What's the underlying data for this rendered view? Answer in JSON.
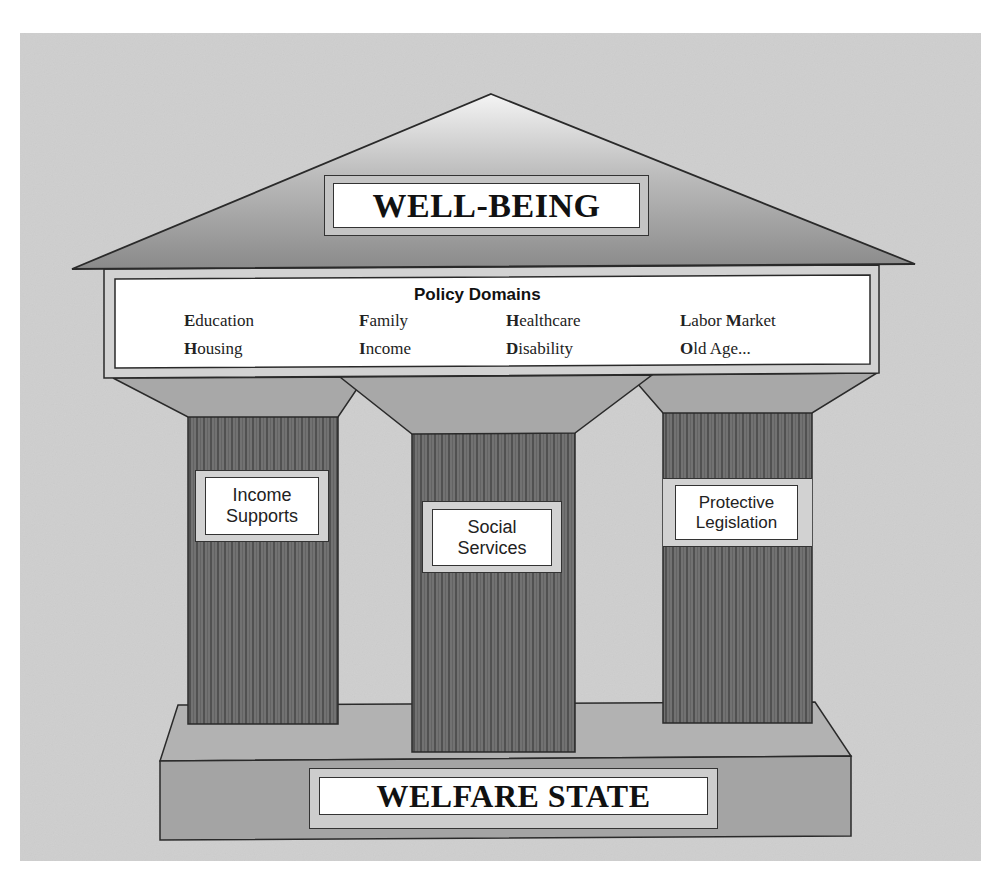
{
  "diagram": {
    "colors": {
      "background_panel": "#cfcfcf",
      "roof_top": "#f2f2f2",
      "roof_bottom": "#8c8c8c",
      "capital_fill": "#a9a9a9",
      "pillar_fill": "#6e6e6e",
      "pillar_stripe": "#3c3c3c",
      "base_top": "#b5b5b5",
      "base_front": "#a3a3a3",
      "outline": "#2a2a2a",
      "label_frame": "#d2d2d2",
      "label_inner": "#ffffff"
    },
    "roof": {
      "label": "WELL-BEING"
    },
    "entablature": {
      "heading": "Policy Domains",
      "domains": [
        {
          "initial": "E",
          "rest": "ducation"
        },
        {
          "initial": "F",
          "rest": "amily"
        },
        {
          "initial": "H",
          "rest": "ealthcare"
        },
        {
          "initial": "L",
          "rest": "abor ",
          "initial2": "M",
          "rest2": "arket"
        },
        {
          "initial": "H",
          "rest": "ousing"
        },
        {
          "initial": "I",
          "rest": "ncome"
        },
        {
          "initial": "D",
          "rest": "isability"
        },
        {
          "initial": "O",
          "rest": "ld Age..."
        }
      ]
    },
    "pillars": [
      {
        "line1": "Income",
        "line2": "Supports"
      },
      {
        "line1": "Social",
        "line2": "Services"
      },
      {
        "line1": "Protective",
        "line2": "Legislation"
      }
    ],
    "base": {
      "label": "WELFARE STATE"
    }
  }
}
